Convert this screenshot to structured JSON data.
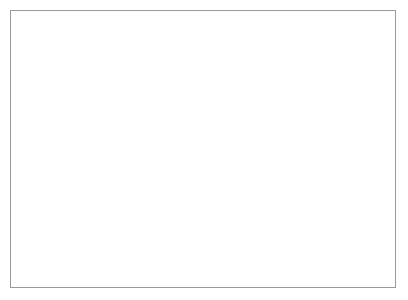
{
  "figure": {
    "background_color": "#ffffff",
    "border_color": "#9a9a9a",
    "line_color": "#111111"
  },
  "chart_data": {
    "type": "line",
    "title": "",
    "xlabel": "Temperature /°C",
    "ylabel": "DSC /mW/mg",
    "xlim": [
      -17,
      207
    ],
    "ylim": [
      -4.15,
      3.6
    ],
    "xticks": [
      0,
      40,
      80,
      120,
      160,
      200
    ],
    "xtick_labels": [
      "0",
      "40",
      "80",
      "120",
      "160",
      "200"
    ],
    "xticks_minor": [
      -20,
      20,
      60,
      100,
      140,
      180
    ],
    "yticks": [
      3,
      2,
      1,
      0,
      -1,
      -2,
      -3,
      -4
    ],
    "ytick_labels": [
      "3",
      "2",
      "1",
      "0",
      "-1",
      "-2",
      "-3",
      "-4"
    ],
    "yticks_minor": [
      3.5,
      2.5,
      1.5,
      0.5,
      -0.5,
      -1.5,
      -2.5,
      -3.5
    ],
    "grid": false,
    "legend": "inline-curve-labels",
    "annotations": [
      {
        "name": "exo-arrow",
        "text": "exo",
        "direction": "down",
        "x": 2,
        "y": 2.55
      },
      {
        "name": "sample-label",
        "text": "HDPE",
        "x": 10,
        "y": -2.95
      }
    ],
    "series": [
      {
        "name": "2nd heating",
        "label_prefix": "2",
        "label_ordinal": "nd",
        "label_suffix": " heating",
        "label_x": 52,
        "label_y": 1.18,
        "peak_temperature": 134,
        "peak_value": 3.2,
        "baseline_start": 0.6,
        "baseline_end": 0.8,
        "points": [
          [
            -17,
            0.6
          ],
          [
            -5,
            0.6
          ],
          [
            8,
            0.605
          ],
          [
            20,
            0.615
          ],
          [
            32,
            0.63
          ],
          [
            44,
            0.65
          ],
          [
            56,
            0.675
          ],
          [
            66,
            0.705
          ],
          [
            75,
            0.74
          ],
          [
            83,
            0.78
          ],
          [
            90,
            0.825
          ],
          [
            96,
            0.875
          ],
          [
            101,
            0.93
          ],
          [
            106,
            1.0
          ],
          [
            110,
            1.07
          ],
          [
            114,
            1.16
          ],
          [
            117,
            1.25
          ],
          [
            120,
            1.36
          ],
          [
            122.5,
            1.47
          ],
          [
            125,
            1.62
          ],
          [
            127,
            1.79
          ],
          [
            128.5,
            1.96
          ],
          [
            130,
            2.2
          ],
          [
            131,
            2.42
          ],
          [
            132,
            2.68
          ],
          [
            132.8,
            2.92
          ],
          [
            133.5,
            3.1
          ],
          [
            134,
            3.2
          ],
          [
            134.6,
            3.18
          ],
          [
            135.2,
            3.03
          ],
          [
            136,
            2.75
          ],
          [
            136.8,
            2.4
          ],
          [
            137.6,
            2.0
          ],
          [
            138.4,
            1.62
          ],
          [
            139.2,
            1.3
          ],
          [
            140,
            1.07
          ],
          [
            141,
            0.93
          ],
          [
            142,
            0.855
          ],
          [
            143.5,
            0.815
          ],
          [
            145,
            0.8
          ],
          [
            150,
            0.795
          ],
          [
            160,
            0.795
          ],
          [
            175,
            0.8
          ],
          [
            190,
            0.8
          ],
          [
            207,
            0.805
          ]
        ]
      },
      {
        "name": "1st heating",
        "label_prefix": "1",
        "label_ordinal": "st",
        "label_suffix": " heating",
        "label_x": 85,
        "label_y": 0.22,
        "peak_temperature": 133,
        "peak_value": 2.5,
        "baseline_start": 0.35,
        "baseline_end": 0.5,
        "start_temperature": 27,
        "points": [
          [
            27,
            0.345
          ],
          [
            38,
            0.35
          ],
          [
            50,
            0.36
          ],
          [
            60,
            0.375
          ],
          [
            70,
            0.395
          ],
          [
            80,
            0.42
          ],
          [
            88,
            0.45
          ],
          [
            95,
            0.485
          ],
          [
            101,
            0.525
          ],
          [
            106,
            0.575
          ],
          [
            110,
            0.63
          ],
          [
            114,
            0.7
          ],
          [
            117,
            0.775
          ],
          [
            120,
            0.875
          ],
          [
            122.5,
            0.985
          ],
          [
            124.5,
            1.1
          ],
          [
            126.5,
            1.26
          ],
          [
            128,
            1.42
          ],
          [
            129.5,
            1.63
          ],
          [
            130.8,
            1.87
          ],
          [
            131.8,
            2.11
          ],
          [
            132.5,
            2.33
          ],
          [
            133,
            2.48
          ],
          [
            133.5,
            2.5
          ],
          [
            134,
            2.42
          ],
          [
            134.8,
            2.2
          ],
          [
            135.6,
            1.9
          ],
          [
            136.4,
            1.58
          ],
          [
            137.2,
            1.3
          ],
          [
            138,
            1.05
          ],
          [
            139,
            0.83
          ],
          [
            140,
            0.68
          ],
          [
            141,
            0.59
          ],
          [
            142.5,
            0.53
          ],
          [
            144,
            0.505
          ],
          [
            147,
            0.495
          ],
          [
            155,
            0.49
          ],
          [
            170,
            0.49
          ],
          [
            185,
            0.495
          ],
          [
            207,
            0.5
          ]
        ]
      },
      {
        "name": "1st cooling",
        "label_prefix": "1",
        "label_ordinal": "st",
        "label_suffix": " cooling",
        "label_x": 124,
        "label_y": -0.72,
        "peak_temperature": 115,
        "peak_value": -3.45,
        "baseline_start": -0.25,
        "baseline_end": -0.4,
        "points": [
          [
            -17,
            -0.25
          ],
          [
            -5,
            -0.253
          ],
          [
            8,
            -0.258
          ],
          [
            20,
            -0.265
          ],
          [
            32,
            -0.272
          ],
          [
            44,
            -0.282
          ],
          [
            56,
            -0.295
          ],
          [
            66,
            -0.31
          ],
          [
            74,
            -0.325
          ],
          [
            80,
            -0.34
          ],
          [
            86,
            -0.36
          ],
          [
            91,
            -0.385
          ],
          [
            95,
            -0.41
          ],
          [
            98,
            -0.44
          ],
          [
            100.5,
            -0.48
          ],
          [
            102.5,
            -0.53
          ],
          [
            104,
            -0.6
          ],
          [
            105.3,
            -0.7
          ],
          [
            106.4,
            -0.84
          ],
          [
            107.3,
            -1.0
          ],
          [
            108.1,
            -1.2
          ],
          [
            108.9,
            -1.45
          ],
          [
            109.7,
            -1.72
          ],
          [
            110.5,
            -2.0
          ],
          [
            111.3,
            -2.3
          ],
          [
            112.1,
            -2.6
          ],
          [
            112.9,
            -2.9
          ],
          [
            113.7,
            -3.15
          ],
          [
            114.4,
            -3.33
          ],
          [
            115,
            -3.45
          ],
          [
            115.6,
            -3.42
          ],
          [
            116.3,
            -3.25
          ],
          [
            117,
            -3.0
          ],
          [
            117.8,
            -2.68
          ],
          [
            118.6,
            -2.3
          ],
          [
            119.4,
            -1.9
          ],
          [
            120.2,
            -1.5
          ],
          [
            121,
            -1.15
          ],
          [
            121.8,
            -0.87
          ],
          [
            122.6,
            -0.66
          ],
          [
            123.5,
            -0.52
          ],
          [
            124.5,
            -0.45
          ],
          [
            126,
            -0.41
          ],
          [
            128,
            -0.398
          ],
          [
            133,
            -0.394
          ],
          [
            145,
            -0.392
          ],
          [
            160,
            -0.392
          ],
          [
            180,
            -0.393
          ],
          [
            207,
            -0.395
          ]
        ]
      }
    ]
  }
}
